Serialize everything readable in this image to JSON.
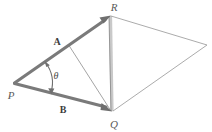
{
  "figure": {
    "type": "vector-diagram",
    "background_color": "#ffffff",
    "width": 212,
    "height": 132,
    "colors": {
      "vector_stroke": "#7a7a7a",
      "thin_stroke": "#9a9a9a",
      "faint_stroke": "#c4c4c4",
      "label_dark": "#3d3d3d",
      "label_gray": "#5a5a5a"
    },
    "vertices": [
      {
        "id": "P",
        "label": "P",
        "x": 14,
        "y": 83,
        "label_x": 11,
        "label_y": 95
      },
      {
        "id": "R",
        "label": "R",
        "x": 110,
        "y": 15,
        "label_x": 113,
        "label_y": 6
      },
      {
        "id": "Q",
        "label": "Q",
        "x": 112,
        "y": 112,
        "label_x": 113,
        "label_y": 124
      },
      {
        "id": "E",
        "label": "",
        "x": 207,
        "y": 45,
        "label_x": 207,
        "label_y": 45
      }
    ],
    "vectors": [
      {
        "id": "A",
        "label": "A",
        "from": "P",
        "to": "R",
        "label_x": 57,
        "label_y": 42,
        "arrowhead": true
      },
      {
        "id": "B",
        "label": "B",
        "from": "P",
        "to": "Q",
        "label_x": 63,
        "label_y": 110,
        "arrowhead": true
      }
    ],
    "angle": {
      "label": "θ",
      "at": "P",
      "label_x": 56,
      "label_y": 76,
      "double_arrow": true
    },
    "segments": [
      {
        "id": "resultant-RQ-thick",
        "from": "R",
        "to": "Q",
        "style": "faint-thick"
      },
      {
        "id": "resultant-RQ-thin",
        "from": "R",
        "to": "Q",
        "style": "thin"
      },
      {
        "id": "median-to-Q",
        "from_point": [
          69,
          45
        ],
        "to": "Q",
        "style": "thin"
      },
      {
        "id": "edge-R-E",
        "from": "R",
        "to": "E",
        "style": "thin"
      },
      {
        "id": "edge-E-Q",
        "from": "E",
        "to": "Q",
        "style": "thin"
      }
    ]
  }
}
